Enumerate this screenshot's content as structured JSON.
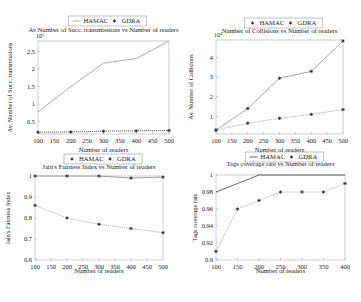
{
  "chart_data": [
    {
      "type": "line",
      "title": "Av Number of Succ. transmissions vs Number of readers",
      "xlabel": "Number of readers",
      "ylabel": "Av. Number of Succ. transmissions",
      "y_multiplier_label": "10^5",
      "x": [
        100,
        200,
        300,
        400,
        500
      ],
      "xticks": [
        100,
        150,
        200,
        250,
        300,
        350,
        400,
        450,
        500
      ],
      "yticks": [
        0.5,
        1,
        1.5,
        2,
        2.5
      ],
      "xlim": [
        100,
        500
      ],
      "ylim": [
        0.15,
        2.8
      ],
      "grid": false,
      "legend_position": "top-center",
      "series": [
        {
          "name": "HAMAC",
          "values": [
            0.78,
            1.5,
            2.17,
            2.3,
            2.8
          ],
          "marker": "none",
          "style": "solid",
          "color": "#a0a0a0"
        },
        {
          "name": "GDRA",
          "values": [
            0.2,
            0.21,
            0.23,
            0.24,
            0.25
          ],
          "marker": "star",
          "style": "dotted",
          "color": "#555555"
        }
      ]
    },
    {
      "type": "line",
      "title": "Number of Collisions vs Number of readers",
      "xlabel": "Number of readers",
      "ylabel": "Av. Number of Collisions",
      "y_multiplier_label": "10^4",
      "x": [
        100,
        200,
        300,
        400,
        500
      ],
      "xticks": [
        100,
        150,
        200,
        250,
        300,
        350,
        400,
        450,
        500
      ],
      "yticks": [
        1,
        2,
        3,
        4
      ],
      "xlim": [
        100,
        500
      ],
      "ylim": [
        0.1,
        4.9
      ],
      "grid": false,
      "legend_position": "top-center",
      "series": [
        {
          "name": "HAMAC",
          "values": [
            0.3,
            1.4,
            2.95,
            3.3,
            4.85
          ],
          "marker": "star",
          "style": "solid",
          "color": "#999999"
        },
        {
          "name": "GDRA",
          "values": [
            0.3,
            0.65,
            0.9,
            1.1,
            1.35
          ],
          "marker": "star",
          "style": "dotted",
          "color": "#aaaaaa"
        }
      ]
    },
    {
      "type": "line",
      "title": "Jain's Fairness Index vs Number of readers",
      "xlabel": "Number of readers",
      "ylabel": "Jain's Fairness Index",
      "x": [
        100,
        200,
        300,
        400,
        500
      ],
      "xticks": [
        100,
        150,
        200,
        250,
        300,
        350,
        400,
        450,
        500
      ],
      "yticks": [
        0.6,
        0.7,
        0.8,
        0.9,
        1
      ],
      "xlim": [
        100,
        500
      ],
      "ylim": [
        0.6,
        1.0
      ],
      "grid": false,
      "legend_position": "top-center",
      "series": [
        {
          "name": "HAMAC",
          "values": [
            1.0,
            1.0,
            1.0,
            0.99,
            0.995
          ],
          "marker": "star",
          "style": "solid",
          "color": "#999999"
        },
        {
          "name": "GDRA",
          "values": [
            0.86,
            0.8,
            0.77,
            0.75,
            0.73
          ],
          "marker": "star",
          "style": "dotted",
          "color": "#aaaaaa"
        }
      ]
    },
    {
      "type": "line",
      "title": "Tags coverage rate vs Number of readers",
      "xlabel": "Number of readers",
      "ylabel": "Tags coverage rate",
      "x": [
        100,
        150,
        200,
        250,
        300,
        350,
        400
      ],
      "xticks": [
        100,
        150,
        200,
        250,
        300,
        350,
        400
      ],
      "yticks": [
        0.9,
        0.92,
        0.94,
        0.96,
        0.98,
        1
      ],
      "xlim": [
        100,
        400
      ],
      "ylim": [
        0.9,
        1.0
      ],
      "grid": false,
      "legend_position": "top-center",
      "series": [
        {
          "name": "HAMAC",
          "values": [
            0.98,
            0.99,
            1.0,
            1.0,
            1.0,
            1.0,
            1.0
          ],
          "marker": "none",
          "style": "solid",
          "color": "#555555"
        },
        {
          "name": "GDRA",
          "values": [
            0.91,
            0.96,
            0.97,
            0.98,
            0.98,
            0.98,
            0.99
          ],
          "marker": "star",
          "style": "dotted",
          "color": "#aaaaaa"
        }
      ]
    }
  ],
  "layout": {
    "panels": [
      {
        "plot": {
          "x": 38,
          "y": 41,
          "w": 131,
          "h": 93
        },
        "legend_y": 22,
        "title_y": 32,
        "ylabel_x": 12,
        "xlabel_y": 152,
        "mult_y": 38
      },
      {
        "plot": {
          "x": 216,
          "y": 40,
          "w": 127,
          "h": 94
        },
        "legend_y": 24,
        "title_y": 33,
        "ylabel_x": 193,
        "xlabel_y": 152,
        "mult_y": 37
      },
      {
        "plot": {
          "x": 35,
          "y": 176,
          "w": 128,
          "h": 84
        },
        "legend_y": 160,
        "title_y": 169,
        "ylabel_x": 10,
        "xlabel_y": 273,
        "mult_y": null
      },
      {
        "plot": {
          "x": 216,
          "y": 175,
          "w": 129,
          "h": 85
        },
        "legend_y": 158,
        "title_y": 166,
        "ylabel_x": 197,
        "xlabel_y": 273,
        "mult_y": null
      }
    ]
  }
}
